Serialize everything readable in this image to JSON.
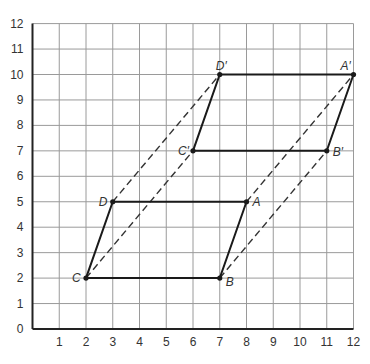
{
  "diagram": {
    "type": "coordinate-grid-translation",
    "x_axis": {
      "min": 0,
      "max": 12,
      "ticks": [
        "1",
        "2",
        "3",
        "4",
        "5",
        "6",
        "7",
        "8",
        "9",
        "10",
        "11",
        "12"
      ]
    },
    "y_axis": {
      "min": 0,
      "max": 12,
      "ticks": [
        "0",
        "1",
        "2",
        "3",
        "4",
        "5",
        "6",
        "7",
        "8",
        "9",
        "10",
        "11",
        "12"
      ]
    },
    "grid": true,
    "colors": {
      "grid": "#9a9a9a",
      "axis": "#222222",
      "shape": "#1a1a1a",
      "dashed": "#333333",
      "text": "#333333"
    },
    "points": [
      {
        "name": "A",
        "label": "A",
        "x": 8,
        "y": 5,
        "label_dx": 6,
        "label_dy": 4
      },
      {
        "name": "B",
        "label": "B",
        "x": 7,
        "y": 2,
        "label_dx": 6,
        "label_dy": 8
      },
      {
        "name": "C",
        "label": "C",
        "x": 2,
        "y": 2,
        "label_dx": -14,
        "label_dy": 4
      },
      {
        "name": "D",
        "label": "D",
        "x": 3,
        "y": 5,
        "label_dx": -14,
        "label_dy": 4
      },
      {
        "name": "A-prime",
        "label": "A′",
        "x": 12,
        "y": 10,
        "label_dx": -13,
        "label_dy": -5
      },
      {
        "name": "B-prime",
        "label": "B′",
        "x": 11,
        "y": 7,
        "label_dx": 6,
        "label_dy": 5
      },
      {
        "name": "C-prime",
        "label": "C′",
        "x": 6,
        "y": 7,
        "label_dx": -15,
        "label_dy": 4
      },
      {
        "name": "D-prime",
        "label": "D′",
        "x": 7,
        "y": 10,
        "label_dx": -4,
        "label_dy": -5
      }
    ],
    "shapes": [
      {
        "name": "parallelogram-ABCD",
        "vertices": [
          "A",
          "B",
          "C",
          "D"
        ]
      },
      {
        "name": "parallelogram-A'B'C'D'",
        "vertices": [
          "A-prime",
          "B-prime",
          "C-prime",
          "D-prime"
        ]
      }
    ],
    "dashed_lines": [
      [
        "A",
        "A-prime"
      ],
      [
        "B",
        "B-prime"
      ],
      [
        "C",
        "C-prime"
      ],
      [
        "D",
        "D-prime"
      ]
    ]
  }
}
